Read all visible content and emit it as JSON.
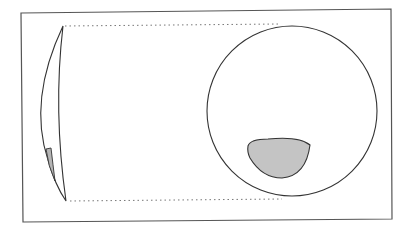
{
  "diagram": {
    "colors": {
      "stroke": "#333333",
      "frame": "#555555",
      "fill_defect": "#c4c4c4",
      "dotted": "#777777",
      "background": "#ffffff"
    },
    "elements": [
      {
        "name": "lens-side-profile",
        "shape": "crescent"
      },
      {
        "name": "lens-front-view",
        "shape": "circle"
      },
      {
        "name": "defect-region-side",
        "shape": "sliver",
        "fill": "grey"
      },
      {
        "name": "defect-region-front",
        "shape": "rounded-triangle",
        "fill": "grey"
      },
      {
        "name": "projection-lines",
        "style": "dotted",
        "count": 2
      }
    ]
  }
}
